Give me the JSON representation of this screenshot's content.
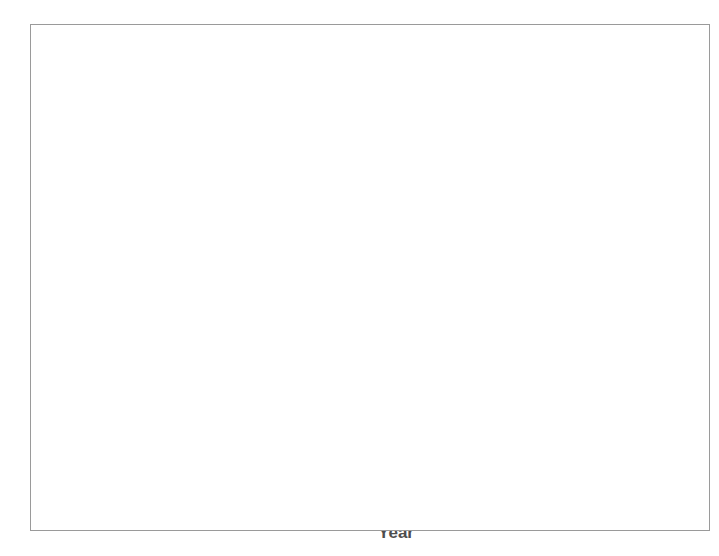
{
  "figure": {
    "background": "#ffffff",
    "frame_color": "#9a9a9a",
    "line_color": "#000000",
    "text_color": "#595959"
  },
  "chart_data": {
    "type": "line",
    "title": "",
    "xlabel": "Year",
    "ylabel": "tonnes",
    "ylim": [
      0,
      2500
    ],
    "yticks": [
      0,
      500,
      1000,
      1500,
      2000,
      2500
    ],
    "grid": false,
    "legend_position": "top-right",
    "x": [
      "1965",
      "1966",
      "1967",
      "1968",
      "1969",
      "1970",
      "1971",
      "1972",
      "1973",
      "1974",
      "1975",
      "1976",
      "1977",
      "1978",
      "1979",
      "1980",
      "1981",
      "1982",
      "1983",
      "1984",
      "1985",
      "1986",
      "1987",
      "1988-89",
      "1989-90",
      "1990-91",
      "1991-92",
      "1992-93",
      "1993-94",
      "1994-95",
      "1995-96",
      "1996-97",
      "1997-98",
      "1998-99",
      "1999-00",
      "2000-01",
      "2001-02",
      "2002-03",
      "2003-04",
      "2004-05",
      "2005-06",
      "2006-07",
      "2007-08",
      "2008-09",
      "2009-10",
      "2010-11",
      "2011-12",
      "2012-13"
    ],
    "xticklabels": [
      "1965",
      "",
      "1967",
      "",
      "1969",
      "",
      "1971",
      "",
      "1973",
      "",
      "1975",
      "",
      "1977",
      "",
      "1979",
      "",
      "1981",
      "",
      "1983",
      "",
      "1985",
      "",
      "1987",
      "",
      "1989-90",
      "",
      "1991-92",
      "",
      "1993-94",
      "",
      "1995-96",
      "",
      "1997-98",
      "",
      "1999-00",
      "",
      "2001-02",
      "",
      "2003-04",
      "",
      "2005-06",
      "",
      "2007-08",
      "",
      "2009-10",
      "",
      "2011-12",
      ""
    ],
    "series": [
      {
        "name": "A. dieffenbachii",
        "style": "dotted",
        "color": "#000000",
        "values": [
          null,
          null,
          null,
          null,
          null,
          null,
          null,
          null,
          null,
          null,
          null,
          null,
          null,
          null,
          null,
          null,
          null,
          null,
          null,
          null,
          null,
          null,
          null,
          null,
          640,
          520,
          600,
          620,
          590,
          700,
          610,
          560,
          520,
          480,
          440,
          400,
          330,
          260,
          230,
          240,
          250,
          215,
          150,
          105,
          130,
          185,
          200,
          240
        ]
      },
      {
        "name": "A. australis",
        "style": "dashed",
        "color": "#000000",
        "values": [
          null,
          null,
          null,
          null,
          null,
          null,
          null,
          null,
          null,
          null,
          null,
          null,
          null,
          null,
          null,
          null,
          null,
          null,
          null,
          null,
          null,
          null,
          null,
          null,
          445,
          700,
          930,
          720,
          760,
          950,
          900,
          890,
          880,
          760,
          730,
          700,
          720,
          680,
          610,
          635,
          620,
          530,
          565,
          530,
          440,
          450,
          510,
          495
        ]
      },
      {
        "name": "total",
        "style": "solid",
        "color": "#000000",
        "values": [
          40,
          55,
          130,
          235,
          440,
          900,
          1500,
          2090,
          1400,
          850,
          1500,
          1100,
          900,
          1570,
          1630,
          1400,
          1120,
          870,
          1280,
          1500,
          1180,
          1150,
          1120,
          1330,
          1090,
          1220,
          1530,
          1290,
          1610,
          1300,
          1510,
          1450,
          1400,
          1250,
          1180,
          1100,
          1050,
          940,
          840,
          880,
          870,
          745,
          715,
          635,
          570,
          635,
          710,
          735
        ]
      }
    ]
  },
  "legend": {
    "items": [
      {
        "label": "A. dieffenbachii",
        "style": "dotted"
      },
      {
        "label": "A. australis",
        "style": "dashed"
      },
      {
        "label": "total",
        "style": "solid"
      }
    ]
  }
}
